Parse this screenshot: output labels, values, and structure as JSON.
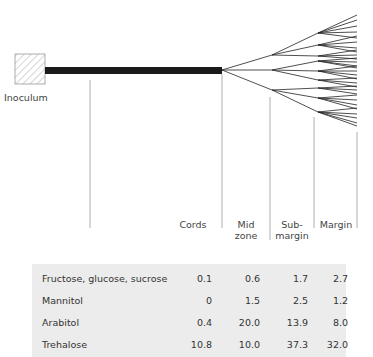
{
  "diagram": {
    "inoculum_label": "Inoculum",
    "zones": [
      {
        "label_line1": "Cords",
        "label_line2": ""
      },
      {
        "label_line1": "Mid",
        "label_line2": "zone"
      },
      {
        "label_line1": "Sub-",
        "label_line2": "margin"
      },
      {
        "label_line1": "Margin",
        "label_line2": ""
      }
    ]
  },
  "table": {
    "columns": [
      "",
      "Cords",
      "Mid zone",
      "Sub-margin",
      "Margin"
    ],
    "rows": [
      {
        "name": "Fructose, glucose, sucrose",
        "values": [
          "0.1",
          "0.6",
          "1.7",
          "2.7"
        ]
      },
      {
        "name": "Mannitol",
        "values": [
          "0",
          "1.5",
          "2.5",
          "1.2"
        ]
      },
      {
        "name": "Arabitol",
        "values": [
          "0.4",
          "20.0",
          "13.9",
          "8.0"
        ]
      },
      {
        "name": "Trehalose",
        "values": [
          "10.8",
          "10.0",
          "37.3",
          "32.0"
        ]
      }
    ]
  }
}
